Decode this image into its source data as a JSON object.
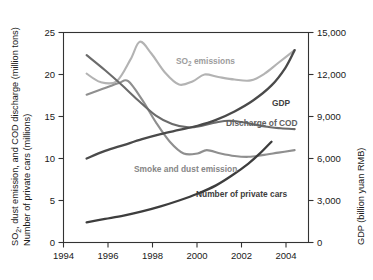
{
  "chart_data": {
    "type": "line",
    "title": "",
    "subtitle": "",
    "xlabel": "",
    "ylabel": "SO2, dust emission, and COD discharge (million tons)  Number of private cars (millions)",
    "ylabel_line1": "SO",
    "ylabel_sub1": "2",
    "ylabel_line1_rest": ", dust emission, and COD discharge (million tons)",
    "ylabel_line2": "Number of private cars (millions)",
    "y2label": "GDP (billion yuan RMB)",
    "xlim": [
      1994,
      2004.6
    ],
    "ylim": [
      0,
      25
    ],
    "y2lim": [
      0,
      15000
    ],
    "grid": false,
    "legend_position": "inline-annotations",
    "x_ticks": [
      1994,
      1996,
      1998,
      2000,
      2002,
      2004
    ],
    "x_tick_labels": [
      "1994",
      "1996",
      "1998",
      "2000",
      "2002",
      "2004"
    ],
    "y_ticks": [
      0,
      5,
      10,
      15,
      20,
      25
    ],
    "y_tick_labels": [
      "0",
      "5",
      "10",
      "15",
      "20",
      "25"
    ],
    "y2_ticks": [
      0,
      3000,
      6000,
      9000,
      12000,
      15000
    ],
    "y2_tick_labels": [
      "0",
      "3,000",
      "6,000",
      "9,000",
      "12,000",
      "15,000"
    ],
    "series": [
      {
        "name": "SO2 emissions",
        "label": "SO2 emissions",
        "label_main": "SO",
        "label_sub": "2",
        "label_rest": " emissions",
        "color": "#b3b3b3",
        "axis": "left",
        "units": "million tons",
        "x": [
          1995,
          1995.6,
          1996.3,
          1996.9,
          1997.3,
          1997.8,
          1998.4,
          1999.0,
          1999.6,
          2000.1,
          2000.7,
          2001.4,
          2002.1,
          2002.7,
          2003.3,
          2004.0
        ],
        "values": [
          20.1,
          19.1,
          19.2,
          21.8,
          23.9,
          22.5,
          20.2,
          18.8,
          19.2,
          20.0,
          19.7,
          19.4,
          19.3,
          20.1,
          21.4,
          22.9
        ]
      },
      {
        "name": "Smoke and dust emission",
        "label": "Smoke and dust emission",
        "color": "#8f8f8f",
        "axis": "left",
        "units": "million tons",
        "x": [
          1995,
          1995.7,
          1996.4,
          1996.8,
          1997.4,
          1998.0,
          1998.6,
          1999.2,
          1999.8,
          2000.2,
          2000.8,
          2001.4,
          2002.0,
          2002.6,
          2003.3,
          2004.0
        ],
        "values": [
          17.6,
          18.3,
          19.0,
          19.2,
          17.0,
          14.3,
          12.0,
          10.6,
          10.6,
          11.0,
          10.6,
          10.3,
          10.2,
          10.4,
          10.7,
          11.0
        ]
      },
      {
        "name": "Discharge of COD",
        "label": "Discharge of COD",
        "color": "#6b6b6b",
        "axis": "left",
        "units": "million tons",
        "x": [
          1995,
          1995.8,
          1996.5,
          1997.2,
          1998.0,
          1998.7,
          1999.4,
          2000.0,
          2000.6,
          2001.2,
          2002.0,
          2002.7,
          2003.4,
          2004.0
        ],
        "values": [
          22.3,
          20.5,
          18.8,
          17.0,
          15.1,
          14.1,
          13.7,
          13.9,
          14.3,
          14.5,
          14.2,
          13.8,
          13.6,
          13.5
        ]
      },
      {
        "name": "GDP",
        "label": "GDP",
        "color": "#4a4a4a",
        "axis": "right",
        "units": "billion yuan RMB",
        "x": [
          1995,
          1995.8,
          1996.6,
          1997.4,
          1998.2,
          1999.0,
          1999.8,
          2000.6,
          2001.4,
          2002.2,
          2003.0,
          2003.6,
          2004.0
        ],
        "values_left_scale": [
          10.0,
          10.9,
          11.6,
          12.3,
          12.9,
          13.4,
          13.9,
          14.6,
          15.6,
          16.9,
          18.7,
          20.8,
          22.9
        ],
        "values": [
          6000,
          6540,
          6960,
          7380,
          7740,
          8040,
          8340,
          8760,
          9360,
          10140,
          11220,
          12480,
          13740
        ]
      },
      {
        "name": "Number of private cars",
        "label": "Number of private cars",
        "color": "#3d3d3d",
        "axis": "left",
        "units": "millions",
        "x": [
          1995,
          1995.8,
          1996.6,
          1997.4,
          1998.2,
          1999.0,
          1999.8,
          2000.6,
          2001.3,
          2002.0,
          2002.5,
          2003.0
        ],
        "values": [
          2.4,
          2.8,
          3.2,
          3.7,
          4.3,
          5.0,
          5.8,
          6.8,
          8.0,
          9.4,
          10.6,
          12.0
        ]
      }
    ],
    "annotations": [
      {
        "name": "so2-label",
        "text": "SO2 emissions",
        "x": 2000.0,
        "y": 21.6
      },
      {
        "name": "gdp-label",
        "text": "GDP",
        "x": 2003.0,
        "y": 18.4
      },
      {
        "name": "cod-label",
        "text": "Discharge of COD",
        "x": 2002.6,
        "y": 15.3
      },
      {
        "name": "smoke-label",
        "text": "Smoke and dust emission",
        "x": 1999.2,
        "y": 9.3
      },
      {
        "name": "cars-label",
        "text": "Number of private cars",
        "x": 2002.4,
        "y": 5.0
      }
    ]
  }
}
